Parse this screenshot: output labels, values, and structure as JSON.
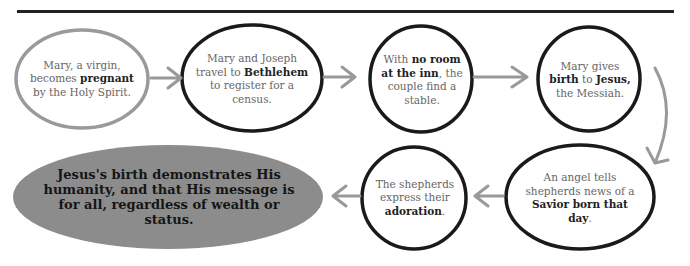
{
  "diagram": {
    "colors": {
      "rule": "#222222",
      "outline_dark": "#1a1a1a",
      "outline_light": "#9a9a9a",
      "arrow": "#999999",
      "final_fill": "#8c8c8c"
    },
    "steps": [
      {
        "id": 1,
        "parts": [
          {
            "t": "Mary, a virgin, becomes "
          },
          {
            "t": "pregnant",
            "b": true
          },
          {
            "t": " by the Holy Spirit."
          }
        ]
      },
      {
        "id": 2,
        "parts": [
          {
            "t": "Mary and Joseph travel to "
          },
          {
            "t": "Bethlehem",
            "b": true
          },
          {
            "t": " to register for a census."
          }
        ]
      },
      {
        "id": 3,
        "parts": [
          {
            "t": "With "
          },
          {
            "t": "no room at the inn",
            "b": true
          },
          {
            "t": ", the couple find a stable."
          }
        ]
      },
      {
        "id": 4,
        "parts": [
          {
            "t": "Mary gives "
          },
          {
            "t": "birth",
            "b": true
          },
          {
            "t": " to "
          },
          {
            "t": "Jesus,",
            "b": true
          },
          {
            "t": " the Messiah."
          }
        ]
      },
      {
        "id": 5,
        "parts": [
          {
            "t": "An angel tells shepherds news of a "
          },
          {
            "t": "Savior born that day",
            "b": true
          },
          {
            "t": "."
          }
        ]
      },
      {
        "id": 6,
        "parts": [
          {
            "t": "The shepherds express their "
          },
          {
            "t": "adoration",
            "b": true
          },
          {
            "t": "."
          }
        ]
      }
    ],
    "conclusion": "Jesus's birth demonstrates His humanity, and that His message is for all, regardless of wealth or status."
  }
}
